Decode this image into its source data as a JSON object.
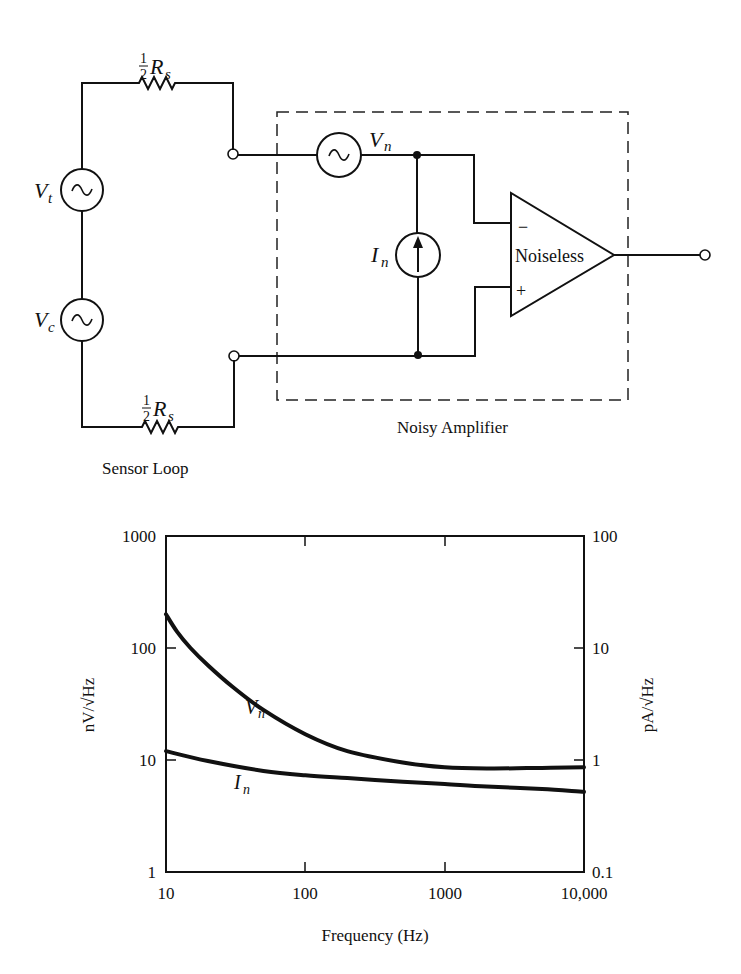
{
  "circuit": {
    "resistor_top": {
      "label_fraction": "1/2",
      "label_num": "1",
      "label_den": "2",
      "label_symbol": "R",
      "label_sub": "s"
    },
    "resistor_bottom": {
      "label_num": "1",
      "label_den": "2",
      "label_symbol": "R",
      "label_sub": "s"
    },
    "source_vt": {
      "symbol": "V",
      "sub": "t",
      "glyph": "~"
    },
    "source_vc": {
      "symbol": "V",
      "sub": "c",
      "glyph": "~"
    },
    "source_vn": {
      "symbol": "V",
      "sub": "n",
      "glyph": "~"
    },
    "source_in": {
      "symbol": "I",
      "sub": "n",
      "glyph": "arrow-up"
    },
    "opamp": {
      "label": "Noiseless",
      "inverting": "−",
      "noninverting": "+"
    },
    "sensor_loop_label": "Sensor Loop",
    "amplifier_box_label": "Noisy Amplifier"
  },
  "chart_data": {
    "type": "line",
    "title": "",
    "xlabel": "Frequency (Hz)",
    "ylabel": "nV/√Hz",
    "ylabel_right": "pA/√Hz",
    "xscale": "log",
    "yscale": "log",
    "xlim": [
      10,
      10000
    ],
    "ylim": [
      1,
      1000
    ],
    "ylim_right": [
      0.1,
      100
    ],
    "grid": false,
    "x_ticks": [
      "10",
      "100",
      "1000",
      "10,000"
    ],
    "y_ticks_left": [
      "1",
      "10",
      "100",
      "1000"
    ],
    "y_ticks_right": [
      "0.1",
      "1",
      "10",
      "100"
    ],
    "series": [
      {
        "name": "Vn",
        "label_symbol": "V",
        "label_sub": "n",
        "axis": "left",
        "x": [
          10,
          12,
          15,
          20,
          30,
          50,
          100,
          200,
          500,
          1000,
          2000,
          5000,
          10000
        ],
        "y": [
          200,
          140,
          100,
          70,
          45,
          28,
          17,
          12,
          9.5,
          8.6,
          8.4,
          8.5,
          8.6
        ]
      },
      {
        "name": "In",
        "label_symbol": "I",
        "label_sub": "n",
        "axis": "right",
        "x": [
          10,
          20,
          50,
          100,
          200,
          500,
          1000,
          2000,
          5000,
          10000
        ],
        "y": [
          1.2,
          0.98,
          0.8,
          0.73,
          0.69,
          0.64,
          0.61,
          0.58,
          0.55,
          0.52
        ]
      }
    ]
  }
}
